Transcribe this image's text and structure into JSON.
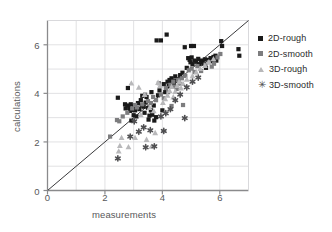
{
  "chart_data": {
    "type": "scatter",
    "title": "",
    "xlabel": "measurements",
    "ylabel": "calculations",
    "xlim": [
      0,
      7
    ],
    "ylim": [
      0,
      7
    ],
    "xticks": [
      0,
      2,
      4,
      6
    ],
    "yticks": [
      0,
      2,
      4,
      6
    ],
    "grid": true,
    "grid_step": 1,
    "legend_position": "right",
    "reference_line": {
      "name": "identity-line",
      "type": "line",
      "slope": 1,
      "intercept": 0,
      "from": [
        0,
        0
      ],
      "to": [
        7,
        7
      ]
    },
    "series": [
      {
        "name": "2D-rough",
        "color": "#1a1a1a",
        "marker": "square",
        "points": [
          [
            2.45,
            3.82
          ],
          [
            2.7,
            3.55
          ],
          [
            2.72,
            3.38
          ],
          [
            2.78,
            3.5
          ],
          [
            2.8,
            4.22
          ],
          [
            2.85,
            3.4
          ],
          [
            2.88,
            3.28
          ],
          [
            2.9,
            3.55
          ],
          [
            2.92,
            2.88
          ],
          [
            2.95,
            3.32
          ],
          [
            3.0,
            3.1
          ],
          [
            3.02,
            3.46
          ],
          [
            3.05,
            3.3
          ],
          [
            3.1,
            3.05
          ],
          [
            3.15,
            3.6
          ],
          [
            3.2,
            3.35
          ],
          [
            3.25,
            3.72
          ],
          [
            3.28,
            3.5
          ],
          [
            3.3,
            3.9
          ],
          [
            3.35,
            3.45
          ],
          [
            3.38,
            3.2
          ],
          [
            3.42,
            3.62
          ],
          [
            3.45,
            3.85
          ],
          [
            3.5,
            3.4
          ],
          [
            3.52,
            2.92
          ],
          [
            3.55,
            3.08
          ],
          [
            3.6,
            3.3
          ],
          [
            3.62,
            4.05
          ],
          [
            3.65,
            3.12
          ],
          [
            3.7,
            3.5
          ],
          [
            3.72,
            2.88
          ],
          [
            3.78,
            3.02
          ],
          [
            3.8,
            6.18
          ],
          [
            3.85,
            3.92
          ],
          [
            3.9,
            4.12
          ],
          [
            3.95,
            6.18
          ],
          [
            4.0,
            3.3
          ],
          [
            4.05,
            4.38
          ],
          [
            4.1,
            4.05
          ],
          [
            4.15,
            6.42
          ],
          [
            4.18,
            4.48
          ],
          [
            4.22,
            4.3
          ],
          [
            4.25,
            4.55
          ],
          [
            4.3,
            4.42
          ],
          [
            4.32,
            4.62
          ],
          [
            4.38,
            4.5
          ],
          [
            4.4,
            4.35
          ],
          [
            4.45,
            4.7
          ],
          [
            4.48,
            4.52
          ],
          [
            4.55,
            4.58
          ],
          [
            4.62,
            4.75
          ],
          [
            4.7,
            4.85
          ],
          [
            4.78,
            5.9
          ],
          [
            4.85,
            5.05
          ],
          [
            4.9,
            5.45
          ],
          [
            4.95,
            5.38
          ],
          [
            4.98,
            5.28
          ],
          [
            5.0,
            5.95
          ],
          [
            5.02,
            5.48
          ],
          [
            5.05,
            5.2
          ],
          [
            5.1,
            5.95
          ],
          [
            5.12,
            5.35
          ],
          [
            5.18,
            5.3
          ],
          [
            5.25,
            5.42
          ],
          [
            5.3,
            5.2
          ],
          [
            5.35,
            5.35
          ],
          [
            5.4,
            5.28
          ],
          [
            5.45,
            5.22
          ],
          [
            5.48,
            5.4
          ],
          [
            5.52,
            5.05
          ],
          [
            5.6,
            5.38
          ],
          [
            5.68,
            5.45
          ],
          [
            5.72,
            5.32
          ],
          [
            5.78,
            5.5
          ],
          [
            5.82,
            5.42
          ],
          [
            5.85,
            5.55
          ],
          [
            5.88,
            5.35
          ],
          [
            6.05,
            6.15
          ],
          [
            6.08,
            5.95
          ],
          [
            6.65,
            5.82
          ],
          [
            6.68,
            5.55
          ]
        ]
      },
      {
        "name": "2D-smooth",
        "color": "#7d7d7f",
        "marker": "square",
        "points": [
          [
            2.18,
            2.22
          ],
          [
            2.42,
            2.9
          ],
          [
            2.5,
            2.85
          ],
          [
            2.62,
            3.05
          ],
          [
            2.78,
            3.2
          ],
          [
            2.95,
            3.38
          ],
          [
            3.05,
            3.52
          ],
          [
            3.12,
            3.42
          ],
          [
            3.3,
            3.55
          ],
          [
            3.4,
            3.95
          ],
          [
            3.5,
            3.68
          ],
          [
            3.6,
            3.6
          ],
          [
            3.68,
            3.85
          ],
          [
            3.78,
            3.72
          ],
          [
            3.88,
            4.42
          ],
          [
            3.95,
            3.95
          ],
          [
            4.05,
            3.8
          ],
          [
            4.12,
            4.22
          ],
          [
            4.2,
            4.05
          ],
          [
            4.28,
            4.35
          ],
          [
            4.32,
            3.48
          ],
          [
            4.38,
            4.48
          ],
          [
            4.42,
            4.28
          ],
          [
            4.5,
            4.18
          ],
          [
            4.55,
            4.55
          ],
          [
            4.6,
            4.4
          ],
          [
            4.68,
            4.62
          ],
          [
            4.72,
            3.52
          ],
          [
            4.8,
            4.72
          ],
          [
            4.92,
            4.95
          ],
          [
            5.02,
            5.02
          ],
          [
            5.12,
            4.88
          ],
          [
            5.22,
            5.12
          ],
          [
            5.35,
            4.92
          ],
          [
            5.5,
            5.18
          ],
          [
            5.62,
            5.28
          ],
          [
            5.72,
            5.1
          ],
          [
            5.8,
            5.22
          ],
          [
            5.92,
            5.48
          ],
          [
            6.02,
            5.62
          ]
        ]
      },
      {
        "name": "3D-rough",
        "color": "#b8b8ba",
        "marker": "triangle",
        "points": [
          [
            2.48,
            1.62
          ],
          [
            2.52,
            1.85
          ],
          [
            2.58,
            2.18
          ],
          [
            2.82,
            1.8
          ],
          [
            2.92,
            4.42
          ],
          [
            3.05,
            2.18
          ],
          [
            3.18,
            4.25
          ],
          [
            3.25,
            3.12
          ],
          [
            3.38,
            3.95
          ],
          [
            3.45,
            2.1
          ],
          [
            3.55,
            3.42
          ],
          [
            3.62,
            1.82
          ],
          [
            3.7,
            3.28
          ],
          [
            3.75,
            2.38
          ],
          [
            3.85,
            4.45
          ],
          [
            3.92,
            4.32
          ],
          [
            4.02,
            3.62
          ],
          [
            4.1,
            3.78
          ],
          [
            4.18,
            3.92
          ],
          [
            4.25,
            4.12
          ],
          [
            4.32,
            4.28
          ],
          [
            4.38,
            3.85
          ],
          [
            4.45,
            4.08
          ],
          [
            4.52,
            4.32
          ],
          [
            4.58,
            4.48
          ],
          [
            4.65,
            4.22
          ],
          [
            4.72,
            4.4
          ],
          [
            4.85,
            4.58
          ],
          [
            5.05,
            4.72
          ],
          [
            5.18,
            4.88
          ],
          [
            5.32,
            5.02
          ],
          [
            5.48,
            5.15
          ],
          [
            5.62,
            5.3
          ],
          [
            5.78,
            5.42
          ]
        ]
      },
      {
        "name": "3D-smooth",
        "color": "#4f4f51",
        "marker": "asterisk",
        "points": [
          [
            2.45,
            1.32
          ],
          [
            2.88,
            2.22
          ],
          [
            3.02,
            2.85
          ],
          [
            3.18,
            2.42
          ],
          [
            3.35,
            2.6
          ],
          [
            3.42,
            1.78
          ],
          [
            3.58,
            2.48
          ],
          [
            3.72,
            1.82
          ],
          [
            3.95,
            3.05
          ],
          [
            4.05,
            2.45
          ],
          [
            4.12,
            3.18
          ],
          [
            4.28,
            3.35
          ],
          [
            4.45,
            3.72
          ],
          [
            4.62,
            3.95
          ],
          [
            4.78,
            2.98
          ],
          [
            4.85,
            4.25
          ],
          [
            5.05,
            4.48
          ],
          [
            5.25,
            4.65
          ]
        ]
      }
    ]
  },
  "legend": {
    "entries": [
      {
        "label": "2D-rough"
      },
      {
        "label": "2D-smooth"
      },
      {
        "label": "3D-rough"
      },
      {
        "label": "3D-smooth"
      }
    ]
  },
  "style": {
    "axis_color": "#8a8a8c",
    "grid_color": "#d9d9dc",
    "line_color": "#3a3a3c",
    "text_color": "#58585a",
    "background": "#ffffff"
  }
}
